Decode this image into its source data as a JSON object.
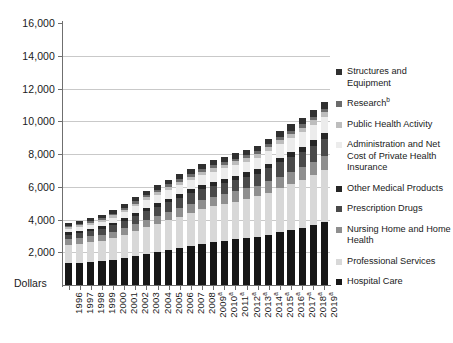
{
  "chart_data": {
    "type": "bar",
    "stacked": true,
    "title": "",
    "subtitle": "",
    "xlabel": "",
    "ylabel": "Dollars",
    "ylim": [
      0,
      16000
    ],
    "ytick_step": 2000,
    "ytick_labels": [
      "16,000",
      "14,000",
      "12,000",
      "10,000",
      "8,000",
      "6,000",
      "4,000",
      "2,000"
    ],
    "ytick_values": [
      16000,
      14000,
      12000,
      10000,
      8000,
      6000,
      4000,
      2000
    ],
    "grid": true,
    "legend_position": "right",
    "categories": [
      "1996",
      "1997",
      "1998",
      "1999",
      "2000",
      "2001",
      "2002",
      "2003",
      "2004",
      "2005",
      "2006",
      "2007",
      "2008",
      "2009",
      "2010",
      "2011",
      "2012",
      "2013",
      "2014",
      "2015",
      "2016",
      "2017",
      "2018",
      "2019"
    ],
    "category_footnotes": [
      "",
      "",
      "",
      "",
      "",
      "",
      "",
      "",
      "",
      "",
      "",
      "",
      "",
      "a",
      "a",
      "a",
      "a",
      "a",
      "a",
      "a",
      "a",
      "a",
      "a",
      "a"
    ],
    "series": [
      {
        "name": "Hospital Care",
        "color": "#171717",
        "values": [
          1320,
          1355,
          1400,
          1455,
          1530,
          1640,
          1775,
          1900,
          2015,
          2135,
          2250,
          2380,
          2510,
          2620,
          2700,
          2790,
          2880,
          2960,
          3080,
          3220,
          3360,
          3490,
          3660,
          3840
        ]
      },
      {
        "name": "Professional Services",
        "color": "#d8d8d8",
        "values": [
          1130,
          1165,
          1205,
          1255,
          1330,
          1425,
          1535,
          1640,
          1740,
          1835,
          1930,
          2030,
          2120,
          2185,
          2240,
          2310,
          2380,
          2450,
          2560,
          2690,
          2810,
          2930,
          3060,
          3205
        ]
      },
      {
        "name": "Nursing Home and Home\nHealth",
        "color": "#8f8f8f",
        "values": [
          345,
          355,
          360,
          370,
          385,
          405,
          430,
          455,
          475,
          500,
          520,
          545,
          570,
          590,
          605,
          620,
          640,
          655,
          685,
          715,
          745,
          775,
          805,
          840
        ]
      },
      {
        "name": "Prescription Drugs",
        "color": "#4a4a4a",
        "values": [
          265,
          290,
          320,
          355,
          395,
          440,
          485,
          525,
          560,
          585,
          625,
          645,
          655,
          675,
          690,
          700,
          715,
          740,
          805,
          865,
          900,
          935,
          980,
          1030
        ]
      },
      {
        "name": "Other Medical Products",
        "color": "#262626",
        "values": [
          155,
          160,
          165,
          172,
          180,
          190,
          200,
          210,
          218,
          226,
          235,
          243,
          248,
          250,
          255,
          262,
          268,
          274,
          284,
          296,
          308,
          320,
          332,
          346
        ]
      },
      {
        "name": "Administration and Net\nCost of Private Health\nInsurance",
        "color": "#ececec",
        "values": [
          200,
          215,
          235,
          265,
          300,
          340,
          395,
          450,
          490,
          520,
          545,
          580,
          600,
          610,
          630,
          640,
          660,
          690,
          775,
          840,
          880,
          915,
          960,
          1010
        ]
      },
      {
        "name": "Public Health Activity",
        "color": "#bdbdbd",
        "values": [
          105,
          110,
          115,
          122,
          130,
          142,
          155,
          168,
          178,
          186,
          194,
          202,
          212,
          222,
          232,
          232,
          230,
          228,
          232,
          240,
          248,
          256,
          266,
          278
        ]
      },
      {
        "name": "Research",
        "footnote": "b",
        "color": "#6b6b6b",
        "values": [
          85,
          90,
          96,
          104,
          114,
          124,
          136,
          146,
          152,
          156,
          158,
          162,
          166,
          170,
          174,
          172,
          170,
          168,
          172,
          178,
          184,
          190,
          198,
          206
        ]
      },
      {
        "name": "Structures and Equipment",
        "color": "#303030",
        "values": [
          170,
          178,
          188,
          200,
          215,
          232,
          252,
          268,
          280,
          292,
          305,
          318,
          325,
          320,
          318,
          322,
          330,
          340,
          355,
          372,
          390,
          408,
          428,
          450
        ]
      }
    ],
    "legend_items": [
      {
        "label": "Structures and Equipment",
        "color": "#303030"
      },
      {
        "label": "Research",
        "footnote": "b",
        "color": "#6b6b6b"
      },
      {
        "label": "Public Health Activity",
        "color": "#bdbdbd"
      },
      {
        "label": "Administration and Net\nCost of Private Health\nInsurance",
        "color": "#ececec"
      },
      {
        "label": "Other Medical Products",
        "color": "#262626"
      },
      {
        "label": "Prescription Drugs",
        "color": "#4a4a4a"
      },
      {
        "label": "Nursing Home and Home\nHealth",
        "color": "#8f8f8f"
      },
      {
        "label": "Professional Services",
        "color": "#d8d8d8"
      },
      {
        "label": "Hospital Care",
        "color": "#171717"
      }
    ],
    "axis_color": "#6f6f6f",
    "grid_color": "#c9c9c9"
  }
}
